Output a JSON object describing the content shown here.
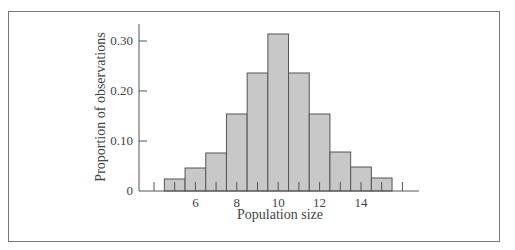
{
  "chart_data": {
    "type": "bar",
    "title": "",
    "xlabel": "Population size",
    "ylabel": "Proportion of observations",
    "categories": [
      5,
      6,
      7,
      8,
      9,
      10,
      11,
      12,
      13,
      14,
      15
    ],
    "values": [
      0.024,
      0.046,
      0.076,
      0.154,
      0.236,
      0.314,
      0.236,
      0.154,
      0.078,
      0.048,
      0.026
    ],
    "xticks": [
      6,
      8,
      10,
      12,
      14
    ],
    "yticks": [
      0,
      0.1,
      0.2,
      0.3
    ],
    "ytick_labels": [
      "0",
      "0.10",
      "0.20",
      "0.30"
    ],
    "xlim": [
      4,
      16.8
    ],
    "ylim": [
      0,
      0.33
    ],
    "grid": false,
    "legend": null,
    "bar_color": "#c8c8c8",
    "edge_color": "#555555"
  }
}
